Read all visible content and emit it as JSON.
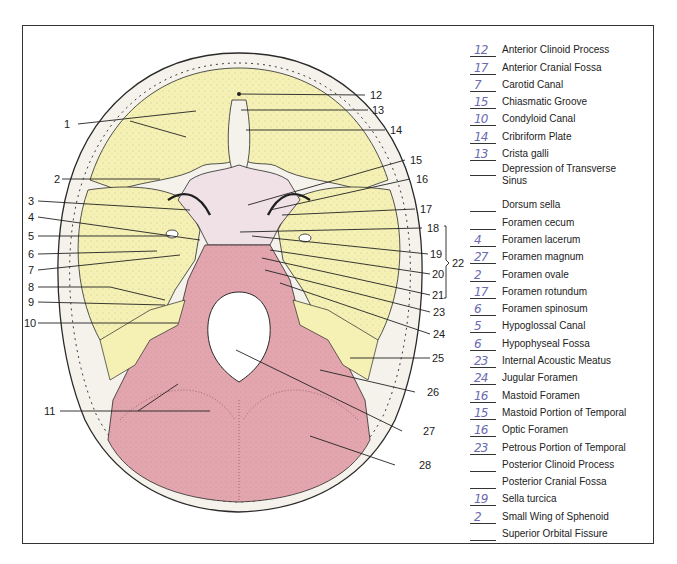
{
  "diagram": {
    "colors": {
      "frontal_sphenoid_temporal": "#f5f0b4",
      "sphenoid_body": "#efe1e6",
      "occipital": "#e3a6af",
      "bone_rim": "#f4f2ea",
      "outline": "#2a2a2a",
      "answer_ink": "#6b6bb0"
    },
    "left_labels": [
      {
        "n": "1",
        "y": 124
      },
      {
        "n": "2",
        "y": 179
      },
      {
        "n": "3",
        "y": 201
      },
      {
        "n": "4",
        "y": 217
      },
      {
        "n": "5",
        "y": 236
      },
      {
        "n": "6",
        "y": 254
      },
      {
        "n": "7",
        "y": 270
      },
      {
        "n": "8",
        "y": 287
      },
      {
        "n": "9",
        "y": 302
      },
      {
        "n": "10",
        "y": 323
      },
      {
        "n": "11",
        "y": 411
      }
    ],
    "right_labels": [
      {
        "n": "12",
        "y": 95
      },
      {
        "n": "13",
        "y": 110
      },
      {
        "n": "14",
        "y": 130
      },
      {
        "n": "15",
        "y": 160
      },
      {
        "n": "16",
        "y": 179
      },
      {
        "n": "17",
        "y": 209
      },
      {
        "n": "18",
        "y": 228
      },
      {
        "n": "19",
        "y": 254
      },
      {
        "n": "20",
        "y": 274
      },
      {
        "n": "21",
        "y": 295
      },
      {
        "n": "23",
        "y": 312
      },
      {
        "n": "24",
        "y": 334
      },
      {
        "n": "25",
        "y": 358
      },
      {
        "n": "26",
        "y": 392
      },
      {
        "n": "27",
        "y": 431
      },
      {
        "n": "28",
        "y": 465
      }
    ],
    "bracket_label": "22"
  },
  "legend": {
    "items": [
      {
        "answer": "12",
        "term": "Anterior Clinoid Process"
      },
      {
        "answer": "17",
        "term": "Anterior Cranial Fossa"
      },
      {
        "answer": "7",
        "term": "Carotid Canal"
      },
      {
        "answer": "15",
        "term": "Chiasmatic Groove"
      },
      {
        "answer": "10",
        "term": "Condyloid Canal"
      },
      {
        "answer": "14",
        "term": "Cribriform Plate"
      },
      {
        "answer": "13",
        "term": "Crista galli"
      },
      {
        "answer": "",
        "term": "Depression of Transverse Sinus",
        "tall": true
      },
      {
        "answer": "",
        "term": "Dorsum sella"
      },
      {
        "answer": "",
        "term": "Foramen cecum"
      },
      {
        "answer": "4",
        "term": "Foramen lacerum"
      },
      {
        "answer": "27",
        "term": "Foramen magnum"
      },
      {
        "answer": "2",
        "term": "Foramen ovale"
      },
      {
        "answer": "17",
        "term": "Foramen rotundum"
      },
      {
        "answer": "6",
        "term": "Foramen spinosum"
      },
      {
        "answer": "5",
        "term": "Hypoglossal Canal"
      },
      {
        "answer": "6",
        "term": "Hypophyseal Fossa"
      },
      {
        "answer": "23",
        "term": "Internal Acoustic Meatus"
      },
      {
        "answer": "24",
        "term": "Jugular Foramen"
      },
      {
        "answer": "16",
        "term": "Mastoid Foramen"
      },
      {
        "answer": "15",
        "term": "Mastoid Portion of Temporal"
      },
      {
        "answer": "16",
        "term": "Optic Foramen"
      },
      {
        "answer": "23",
        "term": "Petrous Portion of Temporal"
      },
      {
        "answer": "",
        "term": "Posterior Clinoid Process"
      },
      {
        "answer": "",
        "term": "Posterior Cranial Fossa"
      },
      {
        "answer": "19",
        "term": "Sella turcica"
      },
      {
        "answer": "2",
        "term": "Small Wing of Sphenoid"
      },
      {
        "answer": "",
        "term": "Superior Orbital Fissure"
      }
    ]
  }
}
